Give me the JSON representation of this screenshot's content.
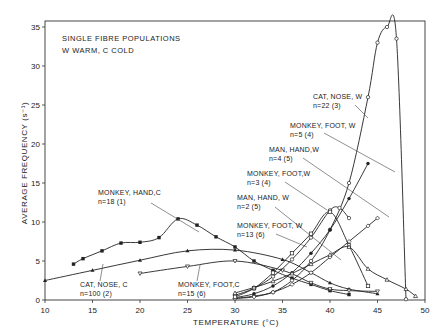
{
  "chart_data": {
    "type": "line",
    "title": "SINGLE FIBRE POPULATIONS",
    "subtitle": "W WARM, C COLD",
    "xlabel": "TEMPERATURE (°C)",
    "ylabel": "AVERAGE FREQUENCY (s⁻¹)",
    "xlim": [
      10,
      50
    ],
    "ylim": [
      0,
      35
    ],
    "xticks": [
      10,
      15,
      20,
      25,
      30,
      35,
      40,
      45,
      50
    ],
    "yticks": [
      0,
      5,
      10,
      15,
      20,
      25,
      30,
      35
    ],
    "grid": false,
    "legend": "inline annotations with leader lines",
    "series": [
      {
        "name": "MONKEY, HAND, C",
        "n": "n=18",
        "ref": "(1)",
        "marker": "filled-square",
        "x": [
          13,
          14,
          16,
          18,
          20,
          22,
          24,
          26,
          28,
          30,
          32,
          34,
          36,
          38,
          40,
          42
        ],
        "y": [
          4.6,
          5.3,
          6.3,
          7.3,
          7.4,
          8.0,
          10.4,
          9.6,
          8.1,
          6.8,
          5.0,
          3.8,
          2.8,
          2.0,
          1.2,
          0.7
        ]
      },
      {
        "name": "CAT, NOSE, C",
        "n": "n=100",
        "ref": "(2)",
        "marker": "filled-triangle",
        "x": [
          10,
          15,
          20,
          25,
          30,
          35,
          38,
          40,
          42,
          45
        ],
        "y": [
          2.5,
          3.8,
          5.1,
          6.3,
          6.4,
          5.2,
          3.5,
          2.2,
          1.4,
          0.8
        ]
      },
      {
        "name": "MONKEY, FOOT, C",
        "n": "n=15",
        "ref": "(6)",
        "marker": "open-triangle-down",
        "x": [
          20,
          25,
          30,
          35,
          38,
          40,
          42,
          45
        ],
        "y": [
          3.4,
          4.3,
          5.0,
          3.8,
          2.2,
          1.4,
          1.2,
          1.1
        ]
      },
      {
        "name": "CAT, NOSE, W",
        "n": "n=22",
        "ref": "(3)",
        "marker": "open-circle",
        "x": [
          30,
          32,
          34,
          36,
          38,
          40,
          42,
          44,
          45,
          46,
          47,
          48
        ],
        "y": [
          0.2,
          0.5,
          1.0,
          2.5,
          5.0,
          9.0,
          15.0,
          26.0,
          33.0,
          35.0,
          33.5,
          0.1
        ]
      },
      {
        "name": "MONKEY, FOOT, W",
        "n": "n=5",
        "ref": "(4)",
        "marker": "filled-circle",
        "x": [
          30,
          32,
          34,
          36,
          38,
          40,
          42,
          44
        ],
        "y": [
          0.3,
          0.8,
          1.8,
          3.5,
          6.0,
          9.0,
          13.0,
          17.5
        ]
      },
      {
        "name": "MAN, HAND, W",
        "n": "n=4",
        "ref": "(5)",
        "marker": "open-diamond",
        "x": [
          30,
          32,
          34,
          36,
          38,
          40,
          42,
          44,
          45
        ],
        "y": [
          0.2,
          0.4,
          1.0,
          2.0,
          3.5,
          5.5,
          7.5,
          9.5,
          10.5
        ]
      },
      {
        "name": "MONKEY, FOOT, W",
        "n": "n=3",
        "ref": "(4)",
        "marker": "open-circle",
        "x": [
          30,
          32,
          34,
          36,
          38,
          40,
          41,
          42
        ],
        "y": [
          0.6,
          1.5,
          3.0,
          5.2,
          8.0,
          11.5,
          11.8,
          10.5
        ]
      },
      {
        "name": "MAN, HAND, W",
        "n": "n=2",
        "ref": "(5)",
        "marker": "open-square",
        "x": [
          30,
          32,
          34,
          36,
          38,
          40,
          42,
          44
        ],
        "y": [
          0.4,
          1.5,
          3.5,
          6.0,
          8.5,
          11.3,
          7.0,
          1.8
        ]
      },
      {
        "name": "MONKEY, FOOT, W",
        "n": "n=13",
        "ref": "(6)",
        "marker": "open-triangle",
        "x": [
          30,
          32,
          34,
          36,
          38,
          40,
          42,
          44,
          46,
          48,
          49
        ],
        "y": [
          0.9,
          1.6,
          2.4,
          3.4,
          4.6,
          5.8,
          6.8,
          4.0,
          2.6,
          1.4,
          0.5
        ]
      }
    ],
    "annotations": [
      {
        "text": "MONKEY, HAND,C",
        "sub": "n=18       (1)"
      },
      {
        "text": "CAT, NOSE, C",
        "sub": "n=100    (2)"
      },
      {
        "text": "MONKEY, FOOT,C",
        "sub": "n=15        (6)"
      },
      {
        "text": "CAT, NOSE, W",
        "sub": "n=22    (3)"
      },
      {
        "text": "MONKEY, FOOT, W",
        "sub": "n=5     (4)"
      },
      {
        "text": "MAN, HAND,W",
        "sub": "n=4     (5)"
      },
      {
        "text": "MONKEY, FOOT,W",
        "sub": "n=3       (4)"
      },
      {
        "text": "MAN, HAND, W",
        "sub": "n=2     (5)"
      },
      {
        "text": "MONKEY, FOOT, W",
        "sub": "n=13     (6)"
      }
    ]
  },
  "labels": {
    "title1": "SINGLE FIBRE POPULATIONS",
    "title2": "W WARM, C COLD",
    "xaxis": "TEMPERATURE  (°C)",
    "yaxis": "AVERAGE  FREQUENCY  (s⁻¹)"
  }
}
